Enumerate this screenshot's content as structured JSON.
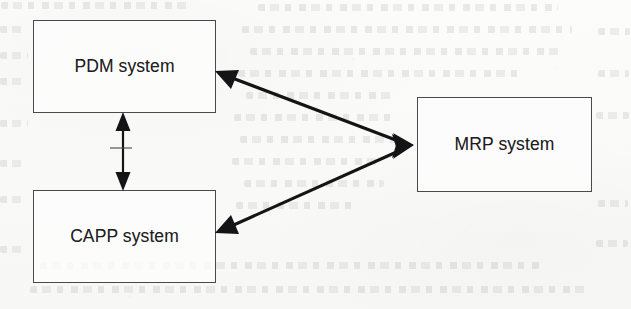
{
  "diagram": {
    "type": "block-diagram",
    "medium": "scanned page with faint reverse-side bleed-through",
    "nodes": [
      {
        "id": "pdm",
        "label": "PDM system",
        "shape": "rectangle",
        "x": 33,
        "y": 20,
        "width": 183,
        "height": 93
      },
      {
        "id": "capp",
        "label": "CAPP system",
        "shape": "rectangle",
        "x": 33,
        "y": 190,
        "width": 183,
        "height": 93
      },
      {
        "id": "mrp",
        "label": "MRP system",
        "shape": "rectangle",
        "x": 417,
        "y": 97,
        "width": 175,
        "height": 95
      }
    ],
    "edges": [
      {
        "id": "pdm-capp",
        "from": "pdm",
        "to": "capp",
        "orientation": "vertical",
        "arrowheads": "both",
        "style": "thin-solid"
      },
      {
        "id": "pdm-mrp",
        "from": "pdm",
        "to": "mrp",
        "orientation": "diagonal",
        "arrowheads": "both",
        "style": "thick-solid"
      },
      {
        "id": "capp-mrp",
        "from": "capp",
        "to": "mrp",
        "orientation": "diagonal",
        "arrowheads": "both",
        "style": "thick-solid"
      }
    ],
    "colors": {
      "paper": "#fbfbfa",
      "box_border": "#4a4a4c",
      "box_fill": "#fdfdfc",
      "label_text": "#1d1d1f",
      "connector": "#141416"
    }
  }
}
